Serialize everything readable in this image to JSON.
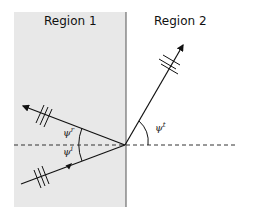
{
  "diagram": {
    "regions": [
      {
        "label": "Region 1",
        "fill": "#e8e8e8"
      },
      {
        "label": "Region 2",
        "fill": "#ffffff"
      }
    ],
    "angles": {
      "reflected": {
        "symbol": "ψ",
        "superscript": "r"
      },
      "incident": {
        "symbol": "ψ",
        "superscript": "i"
      },
      "transmitted": {
        "symbol": "ψ",
        "superscript": "t"
      }
    },
    "rays": [
      "incident",
      "reflected",
      "transmitted"
    ],
    "colors": {
      "line": "#111111",
      "region1": "#e8e8e8",
      "interface": "#555555"
    }
  }
}
